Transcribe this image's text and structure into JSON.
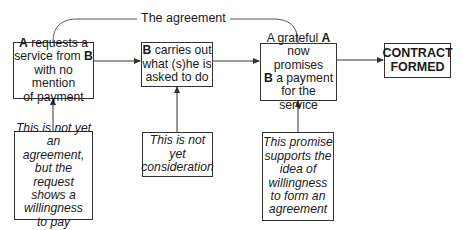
{
  "diagram": {
    "arc_label": "The agreement",
    "steps": [
      {
        "id": "request",
        "parts": [
          {
            "t": "A",
            "b": true
          },
          {
            "t": " requests a\nservice from ",
            "b": false
          },
          {
            "t": "B",
            "b": true
          },
          {
            "t": "\nwith no mention\nof payment",
            "b": false
          }
        ]
      },
      {
        "id": "perform",
        "parts": [
          {
            "t": "B",
            "b": true
          },
          {
            "t": " carries out\nwhat (s)he is\nasked to do",
            "b": false
          }
        ]
      },
      {
        "id": "promise",
        "parts": [
          {
            "t": "A grateful ",
            "b": false
          },
          {
            "t": "A",
            "b": true
          },
          {
            "t": "\nnow promises\n",
            "b": false
          },
          {
            "t": "B",
            "b": true
          },
          {
            "t": " a payment\nfor the service",
            "b": false
          }
        ]
      },
      {
        "id": "result",
        "text": "CONTRACT\nFORMED"
      }
    ],
    "notes": [
      {
        "id": "note-request",
        "text": "This is not yet\nan agreement,\nbut the request\nshows a\nwillingness\nto pay"
      },
      {
        "id": "note-perform",
        "text": "This is not\nyet\nconsideration"
      },
      {
        "id": "note-promise",
        "text": "This promise\nsupports the\nidea of\nwillingness\nto form an\nagreement"
      }
    ],
    "colors": {
      "line": "#333333",
      "text": "#1a1a1a",
      "background": "#ffffff"
    }
  }
}
